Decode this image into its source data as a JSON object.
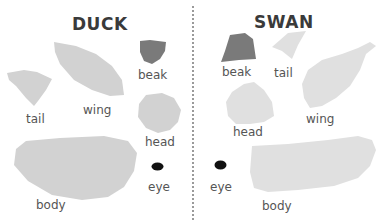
{
  "colors": {
    "light_piece": "#d2d2d2",
    "lighter_piece": "#e0e0e0",
    "beak": "#7a7a7a",
    "eye": "#111111",
    "label": "#555555",
    "divider": "#9a9a9a"
  },
  "duck": {
    "title": "DUCK",
    "labels": {
      "tail": "tail",
      "wing": "wing",
      "beak": "beak",
      "head": "head",
      "body": "body",
      "eye": "eye"
    }
  },
  "swan": {
    "title": "SWAN",
    "labels": {
      "beak": "beak",
      "tail": "tail",
      "head": "head",
      "wing": "wing",
      "eye": "eye",
      "body": "body"
    }
  }
}
